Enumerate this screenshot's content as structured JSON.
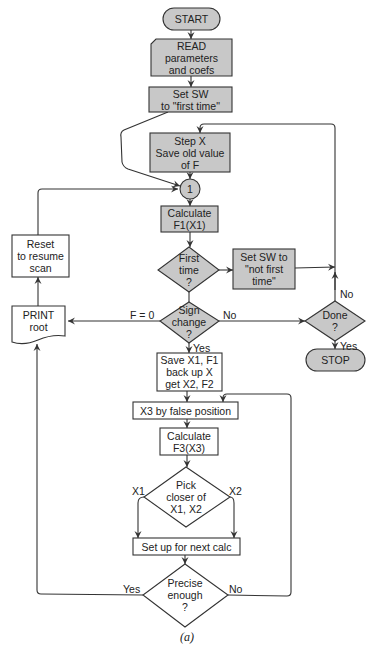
{
  "figure": {
    "caption": "(a)",
    "colors": {
      "shaded_fill": "#c8c8c8",
      "plain_fill": "#ffffff",
      "stroke": "#333333",
      "text": "#222222"
    }
  },
  "nodes": {
    "start": {
      "type": "terminal",
      "lines": [
        "START"
      ]
    },
    "read": {
      "type": "input",
      "lines": [
        "READ",
        "parameters",
        "and coefs"
      ]
    },
    "set_sw_first": {
      "type": "process",
      "lines": [
        "Set SW",
        "to \"first time\""
      ]
    },
    "step_x": {
      "type": "process",
      "lines": [
        "Step X",
        "Save old value",
        "of F"
      ]
    },
    "connector_1": {
      "type": "connector",
      "lines": [
        "1"
      ]
    },
    "calc_f1": {
      "type": "process",
      "lines": [
        "Calculate",
        "F1(X1)"
      ]
    },
    "first_time": {
      "type": "decision",
      "lines": [
        "First",
        "time",
        "?"
      ]
    },
    "set_sw_not_first": {
      "type": "process",
      "lines": [
        "Set SW to",
        "\"not first",
        "time\""
      ]
    },
    "sign_change": {
      "type": "decision",
      "lines": [
        "Sign",
        "change",
        "?"
      ]
    },
    "done": {
      "type": "decision",
      "lines": [
        "Done",
        "?"
      ]
    },
    "stop": {
      "type": "terminal",
      "lines": [
        "STOP"
      ]
    },
    "print_root": {
      "type": "document",
      "lines": [
        "PRINT",
        "root"
      ]
    },
    "reset": {
      "type": "process",
      "lines": [
        "Reset",
        "to resume",
        "scan"
      ]
    },
    "save_x1": {
      "type": "process",
      "lines": [
        "Save X1, F1",
        "back up X",
        "get X2, F2"
      ]
    },
    "x3_false_pos": {
      "type": "process",
      "lines": [
        "X3 by false position"
      ]
    },
    "calc_f3": {
      "type": "process",
      "lines": [
        "Calculate",
        "F3(X3)"
      ]
    },
    "pick_closer": {
      "type": "decision",
      "lines": [
        "Pick",
        "closer of",
        "X1, X2"
      ]
    },
    "setup_next": {
      "type": "process",
      "lines": [
        "Set up for next calc"
      ]
    },
    "precise": {
      "type": "decision",
      "lines": [
        "Precise",
        "enough",
        "?"
      ]
    }
  },
  "edge_labels": {
    "f_eq_0": "F = 0",
    "sign_no": "No",
    "sign_yes": "Yes",
    "done_no": "No",
    "done_yes": "Yes",
    "pick_x1": "X1",
    "pick_x2": "X2",
    "precise_yes": "Yes",
    "precise_no": "No"
  }
}
